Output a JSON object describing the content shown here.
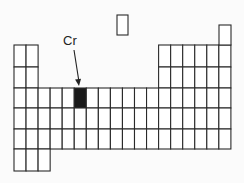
{
  "diagram": {
    "label": "Cr",
    "highlighted_element": "Cr",
    "highlight_color": "#1a1a1a",
    "line_color": "#2a2a2a",
    "grid": {
      "columns": 18,
      "origin_x": 14,
      "col_width": 12.05,
      "row_edges": [
        45,
        67,
        88,
        108,
        129,
        149,
        171
      ],
      "rows": [
        {
          "row": 2,
          "cols": [
            1,
            2,
            13,
            14,
            15,
            16,
            17,
            18
          ]
        },
        {
          "row": 3,
          "cols": [
            1,
            2,
            13,
            14,
            15,
            16,
            17,
            18
          ]
        },
        {
          "row": 4,
          "cols": [
            1,
            2,
            3,
            4,
            5,
            6,
            7,
            8,
            9,
            10,
            11,
            12,
            13,
            14,
            15,
            16,
            17,
            18
          ]
        },
        {
          "row": 5,
          "cols": [
            1,
            2,
            3,
            4,
            5,
            6,
            7,
            8,
            9,
            10,
            11,
            12,
            13,
            14,
            15,
            16,
            17,
            18
          ]
        },
        {
          "row": 6,
          "cols": [
            1,
            2,
            3,
            4,
            5,
            6,
            7,
            8,
            9,
            10,
            11,
            12,
            13,
            14,
            15,
            16,
            17,
            18
          ]
        },
        {
          "row": 7,
          "cols": [
            1,
            2,
            3
          ]
        }
      ],
      "helium_box": {
        "x": 219,
        "y": 25,
        "w": 12,
        "h": 20
      },
      "hydrogen_box": {
        "x": 117,
        "y": 15,
        "w": 11,
        "h": 20
      },
      "highlight_cell": {
        "row": 4,
        "col": 6
      }
    },
    "arrow": {
      "x1": 74,
      "y1": 50,
      "x2": 79,
      "y2": 86
    }
  }
}
